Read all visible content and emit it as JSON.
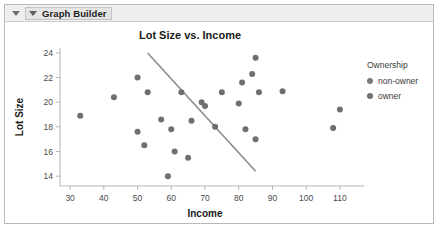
{
  "window": {
    "panel_title": "Graph Builder",
    "disclosure_icon": "triangle-down-icon",
    "outline_icon": "triangle-down-icon"
  },
  "legend": {
    "title": "Ownership",
    "items": [
      {
        "label": "non-owner",
        "color": "#7b7b7b",
        "marker": "circle"
      },
      {
        "label": "owner",
        "color": "#6f6f6f",
        "marker": "circle"
      }
    ]
  },
  "chart_data": {
    "type": "scatter",
    "title": "Lot Size vs. Income",
    "xlabel": "Income",
    "ylabel": "Lot Size",
    "xlim": [
      27,
      113
    ],
    "ylim": [
      13.2,
      24.4
    ],
    "xticks": [
      30,
      40,
      50,
      60,
      70,
      80,
      90,
      100,
      110
    ],
    "yticks": [
      14,
      16,
      18,
      20,
      22,
      24
    ],
    "grid": false,
    "legend_position": "right",
    "point_color": "#6f6f6f",
    "point_radius": 3,
    "series": [
      {
        "name": "observations",
        "x": [
          33,
          43,
          50,
          50,
          52,
          53,
          57,
          59,
          60,
          61,
          63,
          65,
          66,
          69,
          70,
          73,
          75,
          80,
          81,
          82,
          84,
          85,
          85,
          86,
          93,
          108,
          110
        ],
        "y": [
          18.9,
          20.4,
          22.0,
          17.6,
          16.5,
          20.8,
          18.6,
          14.0,
          17.8,
          16.0,
          20.8,
          15.5,
          18.5,
          20.0,
          19.7,
          18.0,
          20.8,
          19.9,
          21.6,
          17.8,
          22.3,
          17.0,
          23.6,
          20.8,
          20.9,
          17.9,
          19.4
        ]
      }
    ],
    "trend_line": {
      "name": "fit-line",
      "color": "#8c8c8c",
      "x_start": 53,
      "y_start": 24.0,
      "x_end": 85,
      "y_end": 14.4
    }
  }
}
